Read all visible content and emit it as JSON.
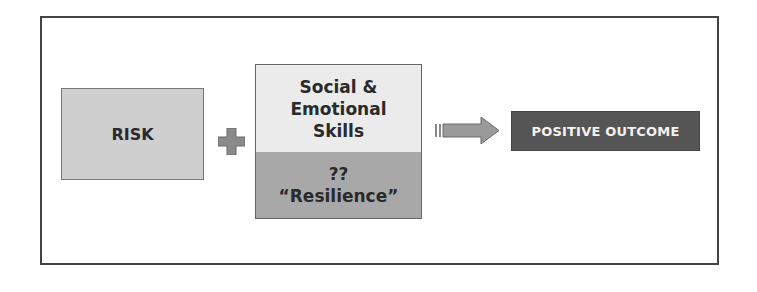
{
  "diagram": {
    "risk_label": "RISK",
    "operator": "plus-icon",
    "middle": {
      "top_lines": [
        "Social &",
        "Emotional",
        "Skills"
      ],
      "bottom_lines": [
        "??",
        "“Resilience”"
      ]
    },
    "connector": "arrow-right-icon",
    "outcome_label": "POSITIVE OUTCOME",
    "colors": {
      "risk_fill": "#cfcfcf",
      "skills_fill": "#ebebeb",
      "resilience_fill": "#a8a8a8",
      "outcome_fill": "#555555",
      "outcome_text": "#f2f2f2",
      "operator_fill": "#8a8a8a",
      "frame_border": "#444444"
    }
  }
}
